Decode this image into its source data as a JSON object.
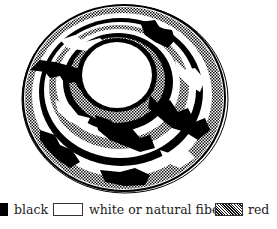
{
  "figure": {
    "colors": {
      "black": "#000000",
      "white": "#ffffff",
      "red_pattern": "#8a8a8a"
    }
  },
  "legend": {
    "items": [
      {
        "swatch": "solid-black",
        "label": "black"
      },
      {
        "swatch": "outlined-white",
        "label": "white or natural fiber"
      },
      {
        "swatch": "hatched",
        "label": "red"
      }
    ]
  }
}
